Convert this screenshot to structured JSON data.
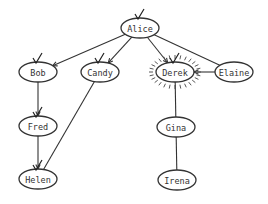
{
  "diagram": {
    "type": "tree-graph",
    "nodes": [
      {
        "id": "alice",
        "label": "Alice",
        "x": 140,
        "y": 28,
        "checked": true,
        "highlighted": false
      },
      {
        "id": "bob",
        "label": "Bob",
        "x": 38,
        "y": 72,
        "checked": true,
        "highlighted": false
      },
      {
        "id": "candy",
        "label": "Candy",
        "x": 100,
        "y": 72,
        "checked": true,
        "highlighted": false
      },
      {
        "id": "derek",
        "label": "Derek",
        "x": 175,
        "y": 72,
        "checked": true,
        "highlighted": true
      },
      {
        "id": "elaine",
        "label": "Elaine",
        "x": 234,
        "y": 72,
        "checked": false,
        "highlighted": false
      },
      {
        "id": "fred",
        "label": "Fred",
        "x": 38,
        "y": 126,
        "checked": true,
        "highlighted": false
      },
      {
        "id": "gina",
        "label": "Gina",
        "x": 176,
        "y": 127,
        "checked": false,
        "highlighted": false
      },
      {
        "id": "helen",
        "label": "Helen",
        "x": 38,
        "y": 179,
        "checked": true,
        "highlighted": false
      },
      {
        "id": "irena",
        "label": "Irena",
        "x": 177,
        "y": 180,
        "checked": false,
        "highlighted": false
      }
    ],
    "edges": [
      {
        "from": "alice",
        "to": "bob",
        "arrow": true
      },
      {
        "from": "alice",
        "to": "candy",
        "arrow": true
      },
      {
        "from": "alice",
        "to": "derek",
        "arrow": true
      },
      {
        "from": "alice",
        "to": "elaine",
        "arrow": false
      },
      {
        "from": "elaine",
        "to": "derek",
        "arrow": true
      },
      {
        "from": "bob",
        "to": "fred",
        "arrow": true
      },
      {
        "from": "fred",
        "to": "helen",
        "arrow": true
      },
      {
        "from": "candy",
        "to": "helen",
        "arrow": false
      },
      {
        "from": "derek",
        "to": "gina",
        "arrow": false
      },
      {
        "from": "gina",
        "to": "irena",
        "arrow": false
      }
    ],
    "colors": {
      "stroke": "#333333",
      "background": "#ffffff",
      "text": "#333333"
    }
  }
}
